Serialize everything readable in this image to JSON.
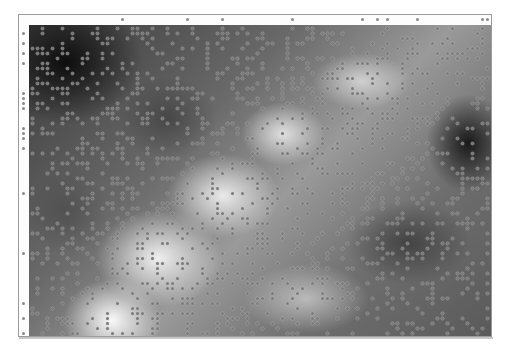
{
  "image": {
    "description": "Grayscale smooth noise field with sparse dot-grid overlay, framed",
    "colors": {
      "background": "#ffffff",
      "frame_border": "#9a9a9a",
      "dark": "#0a0a0a",
      "light": "#fafafa",
      "dot": "#7a7a7a"
    },
    "grid": {
      "spacing_px": 5,
      "density": 0.22,
      "seed": 7
    }
  }
}
